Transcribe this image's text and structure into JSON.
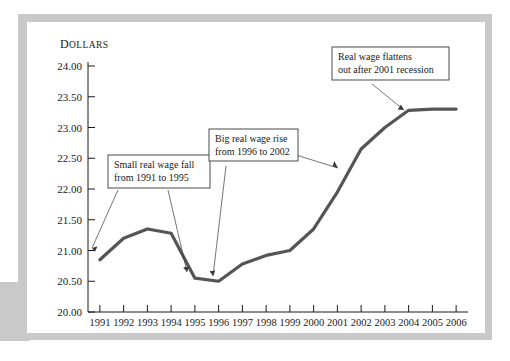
{
  "chart_data": {
    "type": "line",
    "title": "",
    "ylabel": "Dollars",
    "xlabel": "",
    "categories": [
      "1991",
      "1992",
      "1993",
      "1994",
      "1995",
      "1996",
      "1997",
      "1998",
      "1999",
      "2000",
      "2001",
      "2002",
      "2003",
      "2004",
      "2005",
      "2006"
    ],
    "values": [
      20.85,
      21.2,
      21.35,
      21.28,
      20.55,
      20.5,
      20.78,
      20.92,
      21.0,
      21.35,
      21.95,
      22.65,
      23.0,
      23.28,
      23.3,
      23.3
    ],
    "ylim": [
      20.0,
      24.0
    ],
    "ytick_labels": [
      "24.00",
      "23.50",
      "23.00",
      "22.50",
      "22.00",
      "21.50",
      "21.00",
      "20.50",
      "20.00"
    ],
    "ytick_values": [
      24.0,
      23.5,
      23.0,
      22.5,
      22.0,
      21.5,
      21.0,
      20.5,
      20.0
    ],
    "grid": false,
    "legend": "none",
    "line_color": "#555555",
    "annotations": [
      {
        "id": "small-fall",
        "line1": "Small real wage fall",
        "line2": "from 1991 to 1995",
        "points_to": [
          "1991",
          "1995"
        ]
      },
      {
        "id": "big-rise",
        "line1": "Big real wage rise",
        "line2": "from 1996 to 2002",
        "points_to": [
          "1996",
          "2002"
        ]
      },
      {
        "id": "flattens",
        "line1": "Real wage flattens",
        "line2": "out after 2001 recession",
        "points_to": [
          "2004"
        ]
      }
    ]
  },
  "colors": {
    "line": "#555555",
    "axis": "#1a1a1a",
    "panel": "#ffffff",
    "mat": "#c9c9c9",
    "callout_border": "#4a4a4a"
  }
}
